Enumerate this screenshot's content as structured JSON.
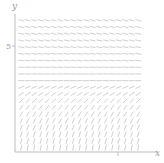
{
  "figure": {
    "kind": "slope-field",
    "background": "#ffffff",
    "stroke_color": "#c9c9c9",
    "axis_color": "#bdbdbd",
    "label_color": "#9a9a9a"
  },
  "axes": {
    "x_axis_label": "x",
    "y_axis_label": "y",
    "y_ticks": [
      {
        "value": 5,
        "label": "5"
      }
    ],
    "x_ticks": [
      {
        "value": 5,
        "label": ""
      }
    ],
    "x_origin_px": 15,
    "y_origin_px": 152,
    "x_max_px": 158,
    "y_top_px": 14,
    "field_left_px": 18,
    "field_right_px": 148,
    "field_top_px": 17,
    "field_bottom_px": 151
  },
  "chart_data": {
    "type": "scatter",
    "title": "",
    "xlabel": "x",
    "ylabel": "y",
    "grid": false,
    "legend": null,
    "xlim": [
      0,
      10
    ],
    "ylim": [
      0,
      10
    ],
    "equilibrium_y": 5,
    "grid_cols": 19,
    "grid_rows": 20,
    "x_samples": [
      0.25,
      0.75,
      1.25,
      1.75,
      2.25,
      2.75,
      3.25,
      3.75,
      4.25,
      4.75,
      5.25,
      5.75,
      6.25,
      6.75,
      7.25,
      7.75,
      8.25,
      8.75,
      9.25
    ],
    "y_samples": [
      9.75,
      9.25,
      8.75,
      8.25,
      7.75,
      7.25,
      6.75,
      6.25,
      5.75,
      5.25,
      4.75,
      4.25,
      3.75,
      3.25,
      2.75,
      2.25,
      1.75,
      1.25,
      0.75,
      0.25
    ],
    "slope_by_y": [
      {
        "y": 9.75,
        "angle_deg": -14
      },
      {
        "y": 9.25,
        "angle_deg": -13
      },
      {
        "y": 8.75,
        "angle_deg": -12
      },
      {
        "y": 8.25,
        "angle_deg": -11
      },
      {
        "y": 7.75,
        "angle_deg": -9
      },
      {
        "y": 7.25,
        "angle_deg": -8
      },
      {
        "y": 6.75,
        "angle_deg": -6
      },
      {
        "y": 6.25,
        "angle_deg": -4
      },
      {
        "y": 5.75,
        "angle_deg": -2
      },
      {
        "y": 5.25,
        "angle_deg": 0
      },
      {
        "y": 4.75,
        "angle_deg": 22
      },
      {
        "y": 4.25,
        "angle_deg": 34
      },
      {
        "y": 3.75,
        "angle_deg": 44
      },
      {
        "y": 3.25,
        "angle_deg": 52
      },
      {
        "y": 2.75,
        "angle_deg": 58
      },
      {
        "y": 2.25,
        "angle_deg": 63
      },
      {
        "y": 1.75,
        "angle_deg": 68
      },
      {
        "y": 1.25,
        "angle_deg": 72
      },
      {
        "y": 0.75,
        "angle_deg": 76
      },
      {
        "y": 0.25,
        "angle_deg": 79
      }
    ],
    "tick_length_px": 5.2
  }
}
